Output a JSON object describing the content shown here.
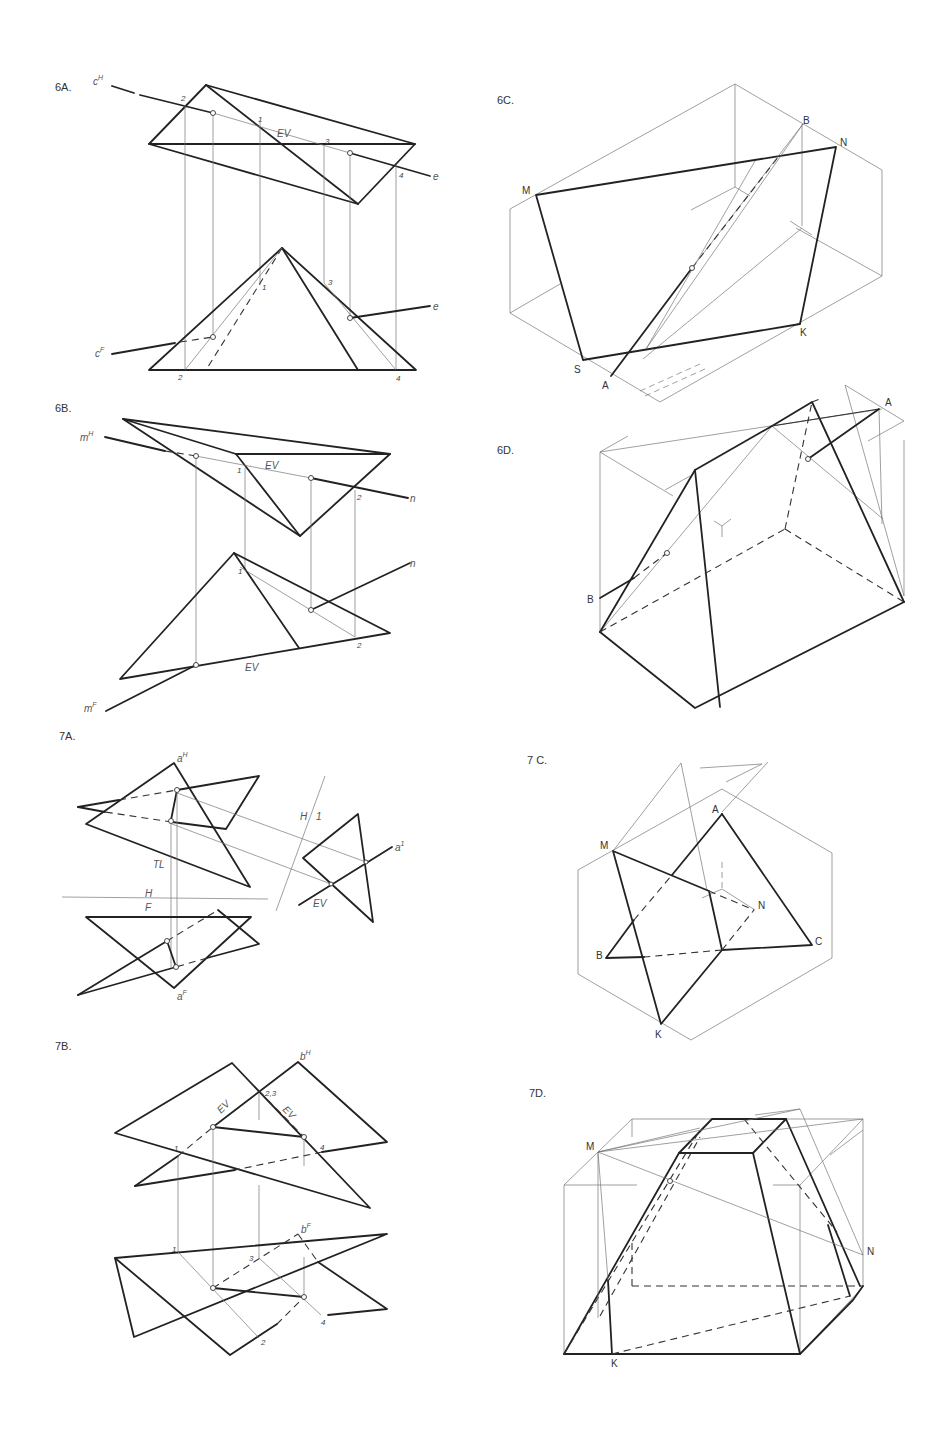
{
  "figures": {
    "fig6A": {
      "label": "6A.",
      "line_labels": {
        "cH": "c",
        "cH_sup": "H",
        "cF": "c",
        "cF_sup": "F",
        "e_top": "e",
        "e_bottom": "e"
      },
      "true_length_label": "EV",
      "points_top": [
        "2",
        "1",
        "3",
        "4"
      ],
      "points_bottom": [
        "2",
        "1",
        "3",
        "4"
      ]
    },
    "fig6B": {
      "label": "6B.",
      "line_labels": {
        "mH": "m",
        "mH_sup": "H",
        "mF": "m",
        "mF_sup": "F",
        "n_top": "n",
        "n_bottom": "n"
      },
      "edge_view_top": "EV",
      "edge_view_bottom": "EV",
      "points_top": [
        "1",
        "2"
      ],
      "points_bottom": [
        "1",
        "2"
      ]
    },
    "fig6C": {
      "label": "6C.",
      "vertices": [
        "M",
        "B",
        "N",
        "S",
        "A",
        "K"
      ]
    },
    "fig6D": {
      "label": "6D.",
      "vertices": [
        "A",
        "B"
      ]
    },
    "fig7A": {
      "label": "7A.",
      "line_labels": {
        "aH": "a",
        "aH_sup": "H",
        "aF": "a",
        "aF_sup": "F",
        "a1": "a",
        "a1_sup": "1"
      },
      "fold_line_HF": {
        "top": "H",
        "bottom": "F"
      },
      "fold_line_H1": {
        "left": "H",
        "right": "1"
      },
      "true_length_label": "TL",
      "edge_view_label": "EV"
    },
    "fig7B": {
      "label": "7B.",
      "line_labels": {
        "bH": "b",
        "bH_sup": "H",
        "bF": "b",
        "bF_sup": "F"
      },
      "edge_view_labels": [
        "EV",
        "EV"
      ],
      "points_top": [
        "2,3",
        "1",
        "4"
      ],
      "points_bottom": [
        "1",
        "3",
        "2",
        "4"
      ]
    },
    "fig7C": {
      "label": "7 C.",
      "vertices": [
        "A",
        "M",
        "N",
        "B",
        "C",
        "K"
      ]
    },
    "fig7D": {
      "label": "7D.",
      "vertices": [
        "M",
        "N",
        "K"
      ]
    }
  }
}
